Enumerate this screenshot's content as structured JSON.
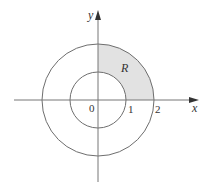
{
  "diagram": {
    "colors": {
      "axis": "#777777",
      "circle": "#6e6e6e",
      "shade": "#e2e2e2",
      "text": "#333333",
      "background": "#ffffff"
    },
    "labels": {
      "y_axis": "y",
      "x_axis": "x",
      "origin": "0",
      "tick_1": "1",
      "tick_2": "2",
      "region": "R"
    },
    "circles": [
      {
        "name": "inner",
        "radius": 1
      },
      {
        "name": "outer",
        "radius": 2
      }
    ],
    "shaded_region": {
      "name": "R",
      "quadrant": "first",
      "r_min": 1,
      "r_max": 2,
      "theta_min_deg": 0,
      "theta_max_deg": 90
    }
  }
}
